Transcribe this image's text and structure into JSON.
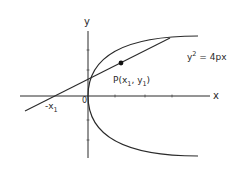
{
  "diagram": {
    "type": "parabola-tangent",
    "axes": {
      "x_label": "x",
      "y_label": "y",
      "origin_label": "0"
    },
    "curve": {
      "equation_base": "y",
      "equation_exp": "2",
      "equation_rhs": " = 4px"
    },
    "point": {
      "label_prefix": "P(x",
      "sub1": "1",
      "mid": ", y",
      "sub2": "1",
      "suffix": ")"
    },
    "intercept": {
      "label": "-x",
      "sub": "1"
    },
    "colors": {
      "stroke": "#2a2a2a",
      "background": "#ffffff"
    }
  }
}
